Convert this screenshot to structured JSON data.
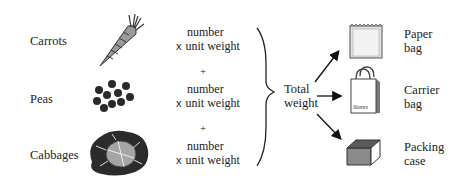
{
  "items": [
    {
      "label": "Carrots",
      "icon": "carrot-icon"
    },
    {
      "label": "Peas",
      "icon": "peas-icon"
    },
    {
      "label": "Cabbages",
      "icon": "cabbage-icon"
    }
  ],
  "calculation": {
    "line1": "number",
    "line2_prefix": "x",
    "line2": "unit weight",
    "plus": "+"
  },
  "total": {
    "line1": "Total",
    "line2": "weight"
  },
  "outputs": [
    {
      "line1": "Paper",
      "line2": "bag",
      "icon": "paper-bag-icon"
    },
    {
      "line1": "Carrier",
      "line2": "bag",
      "icon": "carrier-bag-icon",
      "bag_text": "Stores"
    },
    {
      "line1": "Packing",
      "line2": "case",
      "icon": "packing-case-icon"
    }
  ]
}
